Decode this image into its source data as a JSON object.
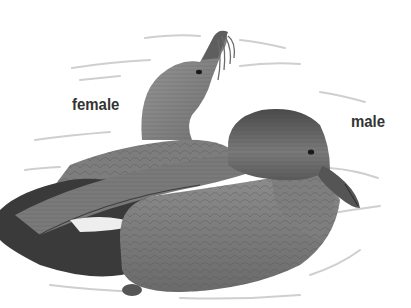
{
  "illustration": {
    "subject": "pair of ducks swimming",
    "style": "grayscale pencil illustration",
    "labels": {
      "female": "female",
      "male": "male"
    },
    "colors": {
      "background": "#ffffff",
      "label_text": "#333333",
      "body_mid": "#8a8a8a",
      "body_dark": "#3a3a3a",
      "water_lines": "#cfcfcf"
    }
  }
}
